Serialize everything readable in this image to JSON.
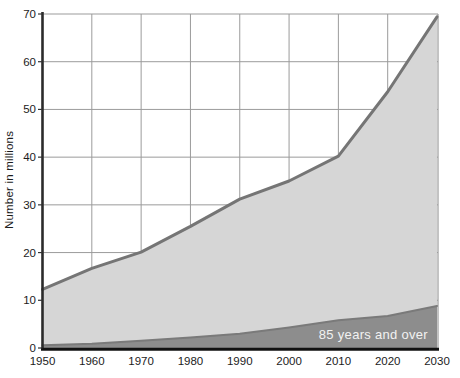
{
  "chart_data": {
    "type": "area",
    "title": "",
    "xlabel": "",
    "ylabel": "Number in millions",
    "x": [
      1950,
      1960,
      1970,
      1980,
      1990,
      2000,
      2010,
      2020,
      2030
    ],
    "x_tick_labels": [
      "1950",
      "1960",
      "1970",
      "1980",
      "1990",
      "2000",
      "2010",
      "2020",
      "2030"
    ],
    "y_ticks": [
      0,
      10,
      20,
      30,
      40,
      50,
      60,
      70
    ],
    "xlim": [
      1950,
      2030
    ],
    "ylim": [
      0,
      70
    ],
    "grid": true,
    "legend_position": "none",
    "series": [
      {
        "name": "",
        "role": "upper",
        "values": [
          12.3,
          16.7,
          20.1,
          25.5,
          31.2,
          35.0,
          40.2,
          53.7,
          69.4
        ],
        "fill": "#d6d6d6",
        "edge": "#757575"
      },
      {
        "name": "85 years and over",
        "role": "lower",
        "values": [
          0.6,
          0.9,
          1.5,
          2.2,
          3.0,
          4.3,
          5.8,
          6.7,
          8.8
        ],
        "fill": "#8d8d8d",
        "edge": "#7a7a7a"
      }
    ],
    "annotation": {
      "text": "85 years and over",
      "color": "#f2f2f2"
    },
    "colors": {
      "grid": "#9b9b9b",
      "axis": "#1c1c1c",
      "tick_label": "#1c1c1c",
      "background": "#ffffff"
    }
  }
}
